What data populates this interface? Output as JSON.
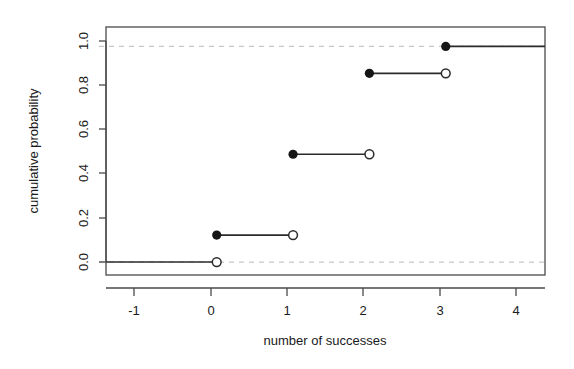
{
  "chart_data": {
    "type": "line",
    "title": "",
    "subtitle": "",
    "xlabel": "number of successes",
    "ylabel": "cumulative probability",
    "xlim": [
      -1.45,
      4.3
    ],
    "ylim": [
      -0.06,
      1.09
    ],
    "xticks": [
      -1,
      0,
      1,
      2,
      3,
      4
    ],
    "xtick_labels": [
      "-1",
      "0",
      "1",
      "2",
      "3",
      "4"
    ],
    "yticks": [
      0.0,
      0.2,
      0.4,
      0.6,
      0.8,
      1.0
    ],
    "ytick_labels": [
      "0.0",
      "0.2",
      "0.4",
      "0.6",
      "0.8",
      "1.0"
    ],
    "grid": false,
    "reference_lines": [
      {
        "y": 0.0,
        "style": "dashed",
        "color": "#c8c8c8"
      },
      {
        "y": 1.0,
        "style": "dashed",
        "color": "#c8c8c8"
      }
    ],
    "legend": null,
    "series": [
      {
        "name": "cumulative distribution function",
        "style": "step",
        "line_color": "#000000",
        "steps": [
          {
            "x_start": -1.45,
            "x_end": 0,
            "y": 0.0,
            "closed_left": false,
            "open_right": true
          },
          {
            "x_start": 0,
            "x_end": 1,
            "y": 0.125,
            "closed_left": true,
            "open_right": true
          },
          {
            "x_start": 1,
            "x_end": 2,
            "y": 0.5,
            "closed_left": true,
            "open_right": true
          },
          {
            "x_start": 2,
            "x_end": 3,
            "y": 0.875,
            "closed_left": true,
            "open_right": true
          },
          {
            "x_start": 3,
            "x_end": 4.3,
            "y": 1.0,
            "closed_left": true,
            "open_right": false
          }
        ],
        "filled_points": [
          {
            "x": 0,
            "y": 0.125
          },
          {
            "x": 1,
            "y": 0.5
          },
          {
            "x": 2,
            "y": 0.875
          },
          {
            "x": 3,
            "y": 1.0
          }
        ],
        "open_points": [
          {
            "x": 0,
            "y": 0.0
          },
          {
            "x": 1,
            "y": 0.125
          },
          {
            "x": 2,
            "y": 0.5
          },
          {
            "x": 3,
            "y": 0.875
          }
        ]
      }
    ]
  },
  "axes": {
    "x_label": "number of successes",
    "y_label": "cumulative probability",
    "x_tick_0": "-1",
    "x_tick_1": "0",
    "x_tick_2": "1",
    "x_tick_3": "2",
    "x_tick_4": "3",
    "x_tick_5": "4",
    "y_tick_0": "0.0",
    "y_tick_1": "0.2",
    "y_tick_2": "0.4",
    "y_tick_3": "0.6",
    "y_tick_4": "0.8",
    "y_tick_5": "1.0"
  },
  "colors": {
    "line": "#2b2b2b",
    "frame": "#4a4a4a",
    "gridline": "#c9c9c9",
    "background": "#ffffff",
    "text": "#1a1a1a"
  }
}
